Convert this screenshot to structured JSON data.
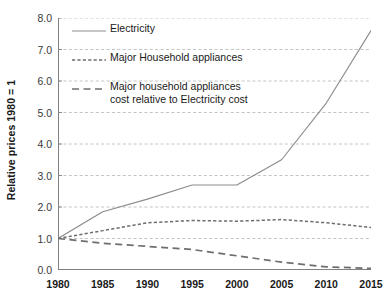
{
  "chart_data": {
    "type": "line",
    "title": "",
    "xlabel": "",
    "ylabel": "Relative prices 1980 = 1",
    "x": [
      1980,
      1985,
      1990,
      1995,
      2000,
      2005,
      2010,
      2015
    ],
    "xtick_labels": [
      "1980",
      "1985",
      "1990",
      "1995",
      "2000",
      "2005",
      "2010",
      "2015"
    ],
    "ytick_labels": [
      "0.0",
      "1.0",
      "2.0",
      "3.0",
      "4.0",
      "5.0",
      "6.0",
      "7.0",
      "8.0"
    ],
    "ytick_values": [
      0,
      1,
      2,
      3,
      4,
      5,
      6,
      7,
      8
    ],
    "ylim": [
      0,
      8
    ],
    "xlim": [
      1980,
      2015
    ],
    "grid": "horizontal-dashed",
    "legend_position": "inside-upper-left",
    "series": [
      {
        "name": "Electricity",
        "style": "solid",
        "color": "#8c8c8c",
        "values": [
          1.0,
          1.85,
          2.25,
          2.7,
          2.7,
          3.5,
          5.3,
          7.6
        ]
      },
      {
        "name": "Major Household appliances",
        "style": "fine-dashed",
        "color": "#6e6e6e",
        "values": [
          1.0,
          1.25,
          1.5,
          1.57,
          1.55,
          1.6,
          1.5,
          1.35
        ]
      },
      {
        "name": "Major household appliances\ncost relative to Electricity cost",
        "style": "long-dashed",
        "color": "#6e6e6e",
        "values": [
          1.0,
          0.85,
          0.75,
          0.65,
          0.45,
          0.25,
          0.1,
          0.05
        ]
      }
    ]
  },
  "axes": {
    "y_title": "Relative prices 1980 = 1"
  },
  "legend": {
    "items": [
      {
        "label": "Electricity",
        "style": "solid"
      },
      {
        "label": "Major Household appliances",
        "style": "fine-dashed"
      },
      {
        "label": "Major household appliances\ncost relative to Electricity cost",
        "style": "long-dashed"
      }
    ]
  },
  "colors": {
    "series_electricity": "#8c8c8c",
    "series_appliances": "#6e6e6e",
    "series_ratio": "#6e6e6e",
    "gridline": "#bdbdbd",
    "axis": "#808080",
    "text": "#1a1a1a"
  }
}
